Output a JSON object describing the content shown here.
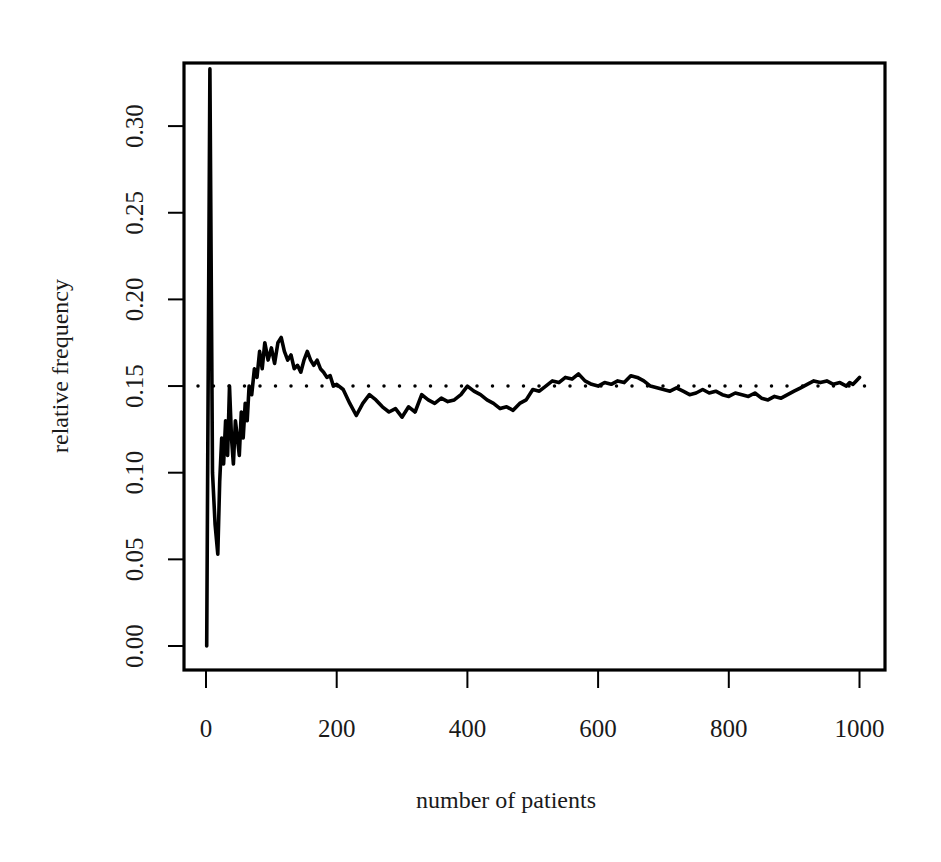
{
  "chart_data": {
    "type": "line",
    "title": "",
    "xlabel": "number of patients",
    "ylabel": "relative frequency",
    "xlim": [
      0,
      1000
    ],
    "ylim": [
      0.0,
      0.333
    ],
    "x_ticks": [
      0,
      200,
      400,
      600,
      800,
      1000
    ],
    "x_tick_labels": [
      "0",
      "200",
      "400",
      "600",
      "800",
      "1000"
    ],
    "y_ticks": [
      0.0,
      0.05,
      0.1,
      0.15,
      0.2,
      0.25,
      0.3
    ],
    "y_tick_labels": [
      "0.00",
      "0.05",
      "0.10",
      "0.15",
      "0.20",
      "0.25",
      "0.30"
    ],
    "grid": false,
    "legend": null,
    "reference_line": {
      "y": 0.15,
      "style": "dotted",
      "color": "#000000"
    },
    "series": [
      {
        "name": "relative frequency",
        "color": "#000000",
        "x": [
          1,
          6,
          10,
          14,
          18,
          21,
          24,
          27,
          30,
          33,
          36,
          39,
          42,
          45,
          48,
          51,
          54,
          57,
          60,
          63,
          66,
          70,
          74,
          78,
          82,
          86,
          90,
          95,
          100,
          105,
          110,
          115,
          120,
          125,
          130,
          135,
          140,
          145,
          150,
          155,
          160,
          165,
          170,
          175,
          180,
          185,
          190,
          195,
          200,
          210,
          220,
          230,
          240,
          250,
          260,
          270,
          280,
          290,
          300,
          310,
          320,
          330,
          340,
          350,
          360,
          370,
          380,
          390,
          400,
          410,
          420,
          430,
          440,
          450,
          460,
          470,
          480,
          490,
          500,
          510,
          520,
          530,
          540,
          550,
          560,
          570,
          580,
          590,
          600,
          610,
          620,
          630,
          640,
          650,
          660,
          670,
          680,
          690,
          700,
          710,
          720,
          730,
          740,
          750,
          760,
          770,
          780,
          790,
          800,
          810,
          820,
          830,
          840,
          850,
          860,
          870,
          880,
          890,
          900,
          910,
          920,
          930,
          940,
          950,
          960,
          970,
          980,
          985,
          990,
          995,
          1000
        ],
        "values": [
          0.0,
          0.333,
          0.1,
          0.07,
          0.053,
          0.095,
          0.12,
          0.105,
          0.13,
          0.11,
          0.15,
          0.12,
          0.105,
          0.13,
          0.12,
          0.11,
          0.135,
          0.12,
          0.14,
          0.13,
          0.15,
          0.145,
          0.16,
          0.155,
          0.17,
          0.16,
          0.175,
          0.165,
          0.172,
          0.163,
          0.175,
          0.178,
          0.17,
          0.165,
          0.168,
          0.16,
          0.162,
          0.158,
          0.165,
          0.17,
          0.165,
          0.162,
          0.165,
          0.16,
          0.158,
          0.155,
          0.156,
          0.15,
          0.151,
          0.148,
          0.14,
          0.133,
          0.14,
          0.145,
          0.142,
          0.138,
          0.135,
          0.137,
          0.132,
          0.138,
          0.135,
          0.145,
          0.142,
          0.14,
          0.143,
          0.141,
          0.142,
          0.145,
          0.15,
          0.147,
          0.145,
          0.142,
          0.14,
          0.137,
          0.138,
          0.136,
          0.14,
          0.142,
          0.148,
          0.147,
          0.15,
          0.153,
          0.152,
          0.155,
          0.154,
          0.157,
          0.153,
          0.151,
          0.15,
          0.152,
          0.151,
          0.153,
          0.152,
          0.156,
          0.155,
          0.153,
          0.15,
          0.149,
          0.148,
          0.147,
          0.149,
          0.147,
          0.145,
          0.146,
          0.148,
          0.146,
          0.147,
          0.145,
          0.144,
          0.146,
          0.145,
          0.144,
          0.146,
          0.143,
          0.142,
          0.144,
          0.143,
          0.145,
          0.147,
          0.149,
          0.151,
          0.153,
          0.152,
          0.153,
          0.151,
          0.152,
          0.15,
          0.152,
          0.151,
          0.153,
          0.155
        ]
      }
    ]
  },
  "layout_map": {
    "plot_box": {
      "left": 184,
      "top": 63,
      "right": 885,
      "bottom": 670
    },
    "x_px_at_0": 206,
    "x_px_per_unit": 0.6535,
    "y_px_at_0": 646,
    "y_px_per_unit": 1733
  }
}
